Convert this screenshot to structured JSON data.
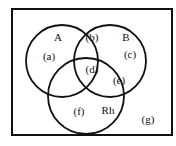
{
  "diagram": {
    "type": "venn",
    "sets": [
      {
        "id": "A",
        "label": "A"
      },
      {
        "id": "B",
        "label": "B"
      },
      {
        "id": "Rh",
        "label": "Rh"
      }
    ],
    "regions": [
      {
        "id": "a",
        "label": "(a)",
        "membership": [
          "A"
        ]
      },
      {
        "id": "b",
        "label": "(b)",
        "membership": [
          "A",
          "B"
        ]
      },
      {
        "id": "c",
        "label": "(c)",
        "membership": [
          "B"
        ]
      },
      {
        "id": "d",
        "label": "(d)",
        "membership": [
          "A",
          "B",
          "Rh"
        ]
      },
      {
        "id": "e",
        "label": "(e)",
        "membership": [
          "B",
          "Rh"
        ]
      },
      {
        "id": "f",
        "label": "(f)",
        "membership": [
          "Rh"
        ]
      },
      {
        "id": "g",
        "label": "(g)",
        "membership": []
      }
    ]
  }
}
